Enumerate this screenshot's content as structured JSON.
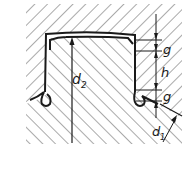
{
  "diagram": {
    "type": "technical-cross-section",
    "labels": {
      "g_top": "g",
      "h": "h",
      "g_bottom": "g",
      "d2": "d",
      "d2_sub": "2",
      "d1": "d",
      "d1_sub": "1"
    },
    "colors": {
      "line": "#1a1a1a",
      "hatch": "#555555",
      "background": "#ffffff"
    }
  }
}
